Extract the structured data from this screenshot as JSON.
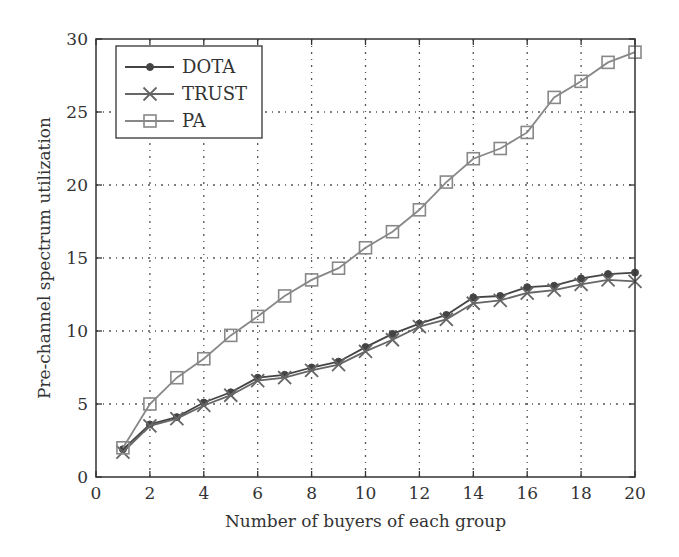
{
  "chart_data": {
    "type": "line",
    "title": "",
    "xlabel": "Number of buyers of each group",
    "ylabel": "Pre-channel spectrum utilization",
    "xlim": [
      0,
      20
    ],
    "ylim": [
      0,
      30
    ],
    "xticks": [
      0,
      2,
      4,
      6,
      8,
      10,
      12,
      14,
      16,
      18,
      20
    ],
    "yticks": [
      0,
      5,
      10,
      15,
      20,
      25,
      30
    ],
    "grid": true,
    "legend_position": "upper left",
    "x": [
      1,
      2,
      3,
      4,
      5,
      6,
      7,
      8,
      9,
      10,
      11,
      12,
      13,
      14,
      15,
      16,
      17,
      18,
      19,
      20
    ],
    "series": [
      {
        "name": "DOTA",
        "marker": "dot",
        "color": "#444444",
        "values": [
          1.9,
          3.6,
          4.1,
          5.1,
          5.8,
          6.8,
          7.0,
          7.5,
          7.9,
          8.9,
          9.8,
          10.5,
          11.1,
          12.3,
          12.4,
          13.0,
          13.1,
          13.6,
          13.9,
          14.0
        ]
      },
      {
        "name": "TRUST",
        "marker": "x",
        "color": "#666666",
        "values": [
          1.7,
          3.5,
          4.0,
          4.9,
          5.6,
          6.6,
          6.8,
          7.3,
          7.7,
          8.6,
          9.4,
          10.3,
          10.8,
          11.9,
          12.1,
          12.6,
          12.8,
          13.2,
          13.5,
          13.4
        ]
      },
      {
        "name": "PA",
        "marker": "square",
        "color": "#888888",
        "values": [
          2.0,
          5.0,
          6.8,
          8.1,
          9.7,
          11.0,
          12.4,
          13.5,
          14.3,
          15.7,
          16.8,
          18.3,
          20.2,
          21.8,
          22.5,
          23.6,
          26.0,
          27.1,
          28.4,
          29.1
        ]
      }
    ]
  }
}
